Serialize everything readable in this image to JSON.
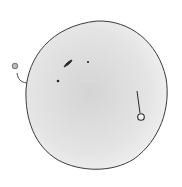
{
  "sketch": {
    "subject": "hand-drawn sphere with small marks",
    "colors": {
      "background": "#ffffff",
      "sphere_fill_center": "#d6d6d6",
      "sphere_fill_edge": "#f0f0f0",
      "stroke": "#3a3a3a",
      "small_circle_fill": "#bdbdbd"
    },
    "sphere": {
      "cx": 97,
      "cy": 95,
      "rx": 71,
      "ry": 75
    },
    "left_balloon": {
      "cx": 15,
      "cy": 66,
      "r": 3
    },
    "right_pin": {
      "x1": 137,
      "y1": 91,
      "x2": 140,
      "y2": 113,
      "cx": 141,
      "cy": 117,
      "r": 3.5
    },
    "marks": [
      {
        "type": "crescent",
        "x": 66,
        "y": 62
      },
      {
        "type": "dot",
        "x": 88,
        "y": 62
      },
      {
        "type": "dot",
        "x": 58,
        "y": 81
      }
    ]
  }
}
